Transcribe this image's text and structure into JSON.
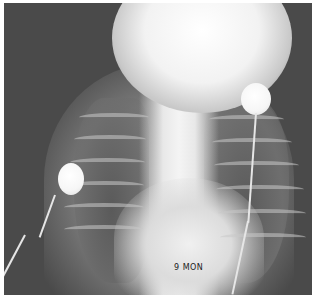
{
  "image": {
    "type": "chest radiograph",
    "view": "frontal",
    "marker_label": "9 MON",
    "colors": {
      "background": "#ffffff",
      "film_dark": "#4a4a4a",
      "bone_bright": "#f2f2f2",
      "electrode": "#f6f6f6"
    },
    "electrodes": [
      {
        "name": "right-chest-electrode",
        "position": "right lower lateral"
      },
      {
        "name": "left-chest-electrode",
        "position": "left upper"
      }
    ]
  }
}
